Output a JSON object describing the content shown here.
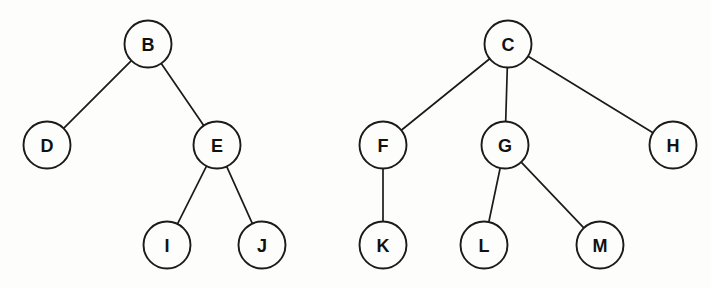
{
  "diagram": {
    "type": "forest-of-trees",
    "canvas": {
      "width": 711,
      "height": 288
    },
    "style": {
      "background_color": "#fdfdfc",
      "node_fill": "#fdfdfc",
      "node_stroke": "#1b1b1b",
      "edge_stroke": "#1b1b1b",
      "label_color": "#111111",
      "node_radius": 23.5
    },
    "trees": [
      {
        "name": "left-tree",
        "root": "B",
        "nodes": [
          {
            "id": "B",
            "label": "B",
            "x": 148,
            "y": 44,
            "level": 0
          },
          {
            "id": "D",
            "label": "D",
            "x": 47,
            "y": 145,
            "level": 1
          },
          {
            "id": "E",
            "label": "E",
            "x": 217,
            "y": 145,
            "level": 1
          },
          {
            "id": "I",
            "label": "I",
            "x": 167,
            "y": 245,
            "level": 2
          },
          {
            "id": "J",
            "label": "J",
            "x": 262,
            "y": 245,
            "level": 2
          }
        ],
        "edges": [
          {
            "from": "B",
            "to": "D"
          },
          {
            "from": "B",
            "to": "E"
          },
          {
            "from": "E",
            "to": "I"
          },
          {
            "from": "E",
            "to": "J"
          }
        ]
      },
      {
        "name": "right-tree",
        "root": "C",
        "nodes": [
          {
            "id": "C",
            "label": "C",
            "x": 508,
            "y": 44,
            "level": 0
          },
          {
            "id": "F",
            "label": "F",
            "x": 383,
            "y": 145,
            "level": 1
          },
          {
            "id": "G",
            "label": "G",
            "x": 505,
            "y": 145,
            "level": 1
          },
          {
            "id": "H",
            "label": "H",
            "x": 673,
            "y": 145,
            "level": 1
          },
          {
            "id": "K",
            "label": "K",
            "x": 383,
            "y": 245,
            "level": 2
          },
          {
            "id": "L",
            "label": "L",
            "x": 484,
            "y": 245,
            "level": 2
          },
          {
            "id": "M",
            "label": "M",
            "x": 600,
            "y": 245,
            "level": 2
          }
        ],
        "edges": [
          {
            "from": "C",
            "to": "F"
          },
          {
            "from": "C",
            "to": "G"
          },
          {
            "from": "C",
            "to": "H"
          },
          {
            "from": "F",
            "to": "K"
          },
          {
            "from": "G",
            "to": "L"
          },
          {
            "from": "G",
            "to": "M"
          }
        ]
      }
    ]
  }
}
